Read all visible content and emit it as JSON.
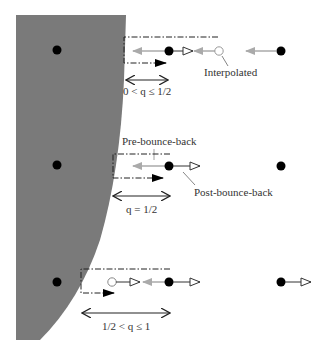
{
  "diagram": {
    "colors": {
      "wall": "#7a7a7a",
      "node": "#000000",
      "grey_arrow": "#aaaaaa",
      "dark_line": "#222222",
      "interp_node": "#999999"
    },
    "labels": {
      "interpolated": "Interpolated",
      "pre_bounce_back": "Pre-bounce-back",
      "post_bounce_back": "Post-bounce-back",
      "case1": "0 < q ≤ 1/2",
      "case2": "q = 1/2",
      "case3": "1/2 < q ≤ 1"
    },
    "cases": [
      {
        "name": "case-q-less-half",
        "label_key": "case1"
      },
      {
        "name": "case-q-equal-half",
        "label_key": "case2"
      },
      {
        "name": "case-q-greater-half",
        "label_key": "case3"
      }
    ]
  }
}
